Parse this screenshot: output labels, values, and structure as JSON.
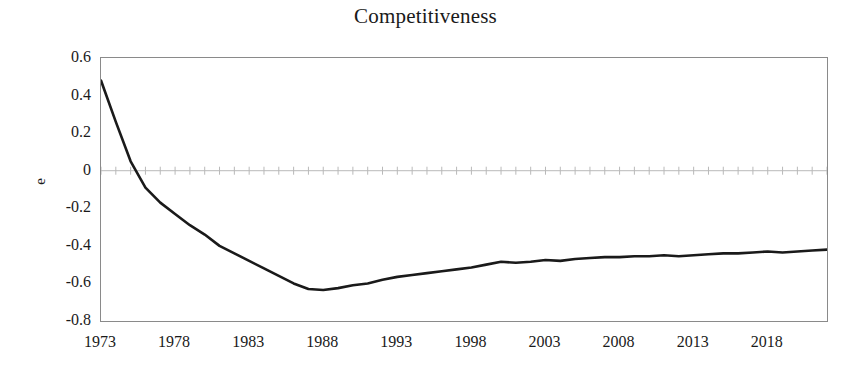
{
  "chart_data": {
    "type": "line",
    "title": "Competitiveness",
    "xlabel": "",
    "ylabel": "e",
    "xlim": [
      1973,
      2022
    ],
    "ylim": [
      -0.8,
      0.6
    ],
    "grid": false,
    "legend": null,
    "x_tick_labels": [
      "1973",
      "1978",
      "1983",
      "1988",
      "1993",
      "1998",
      "2003",
      "2008",
      "2013",
      "2018"
    ],
    "x_ticks": [
      1973,
      1978,
      1983,
      1988,
      1993,
      1998,
      2003,
      2008,
      2013,
      2018
    ],
    "y_tick_labels": [
      "0.6",
      "0.4",
      "0.2",
      "0",
      "-0.2",
      "-0.4",
      "-0.6",
      "-0.8"
    ],
    "y_ticks": [
      0.6,
      0.4,
      0.2,
      0,
      -0.2,
      -0.4,
      -0.6,
      -0.8
    ],
    "zero_line": 0,
    "line_color": "#1a1a1a",
    "line_width": 2.6,
    "axis_color": "#8a8a8a",
    "series": [
      {
        "name": "e",
        "x": [
          1973,
          1974,
          1975,
          1976,
          1977,
          1978,
          1979,
          1980,
          1981,
          1982,
          1983,
          1984,
          1985,
          1986,
          1987,
          1988,
          1989,
          1990,
          1991,
          1992,
          1993,
          1994,
          1995,
          1996,
          1997,
          1998,
          1999,
          2000,
          2001,
          2002,
          2003,
          2004,
          2005,
          2006,
          2007,
          2008,
          2009,
          2010,
          2011,
          2012,
          2013,
          2014,
          2015,
          2016,
          2017,
          2018,
          2019,
          2020,
          2021,
          2022
        ],
        "values": [
          0.48,
          0.26,
          0.05,
          -0.09,
          -0.17,
          -0.23,
          -0.29,
          -0.34,
          -0.4,
          -0.44,
          -0.48,
          -0.52,
          -0.56,
          -0.6,
          -0.63,
          -0.635,
          -0.625,
          -0.61,
          -0.6,
          -0.58,
          -0.565,
          -0.555,
          -0.545,
          -0.535,
          -0.525,
          -0.515,
          -0.5,
          -0.485,
          -0.49,
          -0.485,
          -0.475,
          -0.48,
          -0.47,
          -0.465,
          -0.46,
          -0.46,
          -0.455,
          -0.455,
          -0.45,
          -0.455,
          -0.45,
          -0.445,
          -0.44,
          -0.44,
          -0.435,
          -0.43,
          -0.435,
          -0.43,
          -0.425,
          -0.42
        ]
      }
    ]
  }
}
